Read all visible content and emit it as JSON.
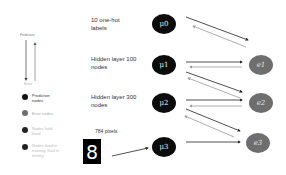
{
  "legend": {
    "top_label": "Predictions",
    "bottom_label": "Errors",
    "items": [
      {
        "label": "Prediction nodes",
        "color": "#111111"
      },
      {
        "label": "Error nodes",
        "color": "#6e6e6e"
      },
      {
        "label": "Nodes held fixed",
        "color": "#222222"
      },
      {
        "label": "Nodes fixed in training, fluid in testing",
        "color": "#222222"
      }
    ]
  },
  "layers": [
    {
      "label": "10 one-hot labels",
      "node": "μ0",
      "error": null
    },
    {
      "label": "Hidden layer 100 nodes",
      "node": "μ1",
      "error": "e1"
    },
    {
      "label": "Hidden layer 300 nodes",
      "node": "μ2",
      "error": "e2"
    },
    {
      "label": "784 pixels",
      "node": "μ3",
      "error": "e3"
    }
  ],
  "input_image": {
    "digit": "8"
  },
  "colors": {
    "prediction_node": "#0c0c0c",
    "error_node": "#6e6e6e",
    "prediction_arrow": "#222222",
    "error_arrow": "#9a9a9a"
  }
}
